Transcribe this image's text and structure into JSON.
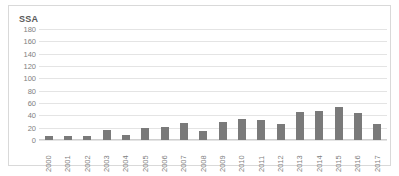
{
  "chart_data": {
    "type": "bar",
    "title": "SSA",
    "xlabel": "",
    "ylabel": "",
    "ylim": [
      0,
      180
    ],
    "ytick_values": [
      180,
      160,
      140,
      120,
      100,
      80,
      60,
      40,
      20,
      0
    ],
    "grid": true,
    "legend": "none",
    "bar_color": "#7a7a7a",
    "categories": [
      "2000",
      "2001",
      "2002",
      "2003",
      "2004",
      "2005",
      "2006",
      "2007",
      "2008",
      "2009",
      "2010",
      "2011",
      "2012",
      "2013",
      "2014",
      "2015",
      "2016",
      "2017"
    ],
    "values": [
      7,
      6,
      6,
      17,
      8,
      20,
      21,
      28,
      15,
      30,
      34,
      33,
      26,
      45,
      47,
      53,
      43,
      26
    ],
    "series": [
      {
        "name": "SSA",
        "values": [
          7,
          6,
          6,
          17,
          8,
          20,
          21,
          28,
          15,
          30,
          34,
          33,
          26,
          45,
          47,
          53,
          43,
          26
        ]
      }
    ]
  },
  "colors": {
    "bar": "#7a7a7a",
    "gridline": "#e4e4e4",
    "frame": "#d9d9d9",
    "tick_text": "#808080",
    "title_text": "#595959"
  }
}
